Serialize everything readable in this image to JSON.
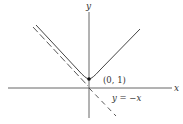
{
  "diagram": {
    "axes": {
      "x_label": "x",
      "y_label": "y"
    },
    "curve": {
      "description": "upper branch of hyperbola y = sqrt(x^2 + 1)",
      "vertex_label": "(0, 1)"
    },
    "asymptote": {
      "label": "y = −x",
      "style": "dashed"
    },
    "colors": {
      "line": "#333333",
      "background": "#ffffff"
    }
  }
}
